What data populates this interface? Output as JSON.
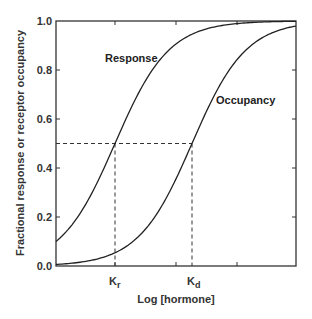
{
  "chart_data": {
    "type": "line",
    "title": "",
    "xlabel": "Log [hormone]",
    "ylabel": "Fractional response or receptor occupancy",
    "ylim": [
      0.0,
      1.0
    ],
    "yticks": [
      "0.0",
      "0.2",
      "0.4",
      "0.6",
      "0.8",
      "1.0"
    ],
    "xtick_labels": [
      {
        "label": "K",
        "sub": "r",
        "position": "Kr"
      },
      {
        "label": "K",
        "sub": "d",
        "position": "Kd"
      }
    ],
    "grid": false,
    "legend": "inline labels",
    "series": [
      {
        "name": "Response",
        "shape": "sigmoid",
        "midpoint": "Kr",
        "y_at_left_edge": 0.1,
        "y_at_right_edge": 1.0
      },
      {
        "name": "Occupancy",
        "shape": "sigmoid",
        "midpoint": "Kd",
        "y_at_left_edge": 0.0,
        "y_at_right_edge": 0.98
      }
    ],
    "annotations": [
      {
        "type": "dashed-horizontal",
        "y": 0.5,
        "from": "y-axis",
        "to": "Kd"
      },
      {
        "type": "dashed-vertical",
        "x": "Kr",
        "from": 0.0,
        "to": 0.5
      },
      {
        "type": "dashed-vertical",
        "x": "Kd",
        "from": 0.0,
        "to": 0.5
      }
    ]
  },
  "labels": {
    "response": "Response",
    "occupancy": "Occupancy",
    "xlabel": "Log [hormone]",
    "ylabel": "Fractional response or receptor occupancy",
    "kr_main": "K",
    "kr_sub": "r",
    "kd_main": "K",
    "kd_sub": "d",
    "y0": "0.0",
    "y1": "0.2",
    "y2": "0.4",
    "y3": "0.6",
    "y4": "0.8",
    "y5": "1.0"
  }
}
